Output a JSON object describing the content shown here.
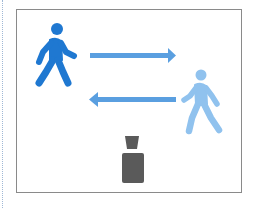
{
  "diagram": {
    "elements": [
      {
        "id": "person-left",
        "icon": "walking-person-icon",
        "color": "#1f78d1",
        "position": "top-left",
        "facing": "right"
      },
      {
        "id": "arrow-right",
        "icon": "arrow-right-icon",
        "color": "#5a9fe0",
        "direction": "right"
      },
      {
        "id": "arrow-left",
        "icon": "arrow-left-icon",
        "color": "#5a9fe0",
        "direction": "left"
      },
      {
        "id": "person-right",
        "icon": "walking-person-icon",
        "color": "#90c2ee",
        "position": "middle-right",
        "facing": "right"
      },
      {
        "id": "object",
        "icon": "device-icon",
        "color": "#5a5a5a",
        "position": "bottom-center"
      }
    ],
    "colors": {
      "frame_border": "#8a8a8a",
      "guide_line": "#9fb8d6",
      "primary_blue": "#1f78d1",
      "arrow_blue": "#5a9fe0",
      "light_blue": "#90c2ee",
      "object_gray": "#5a5a5a"
    }
  }
}
